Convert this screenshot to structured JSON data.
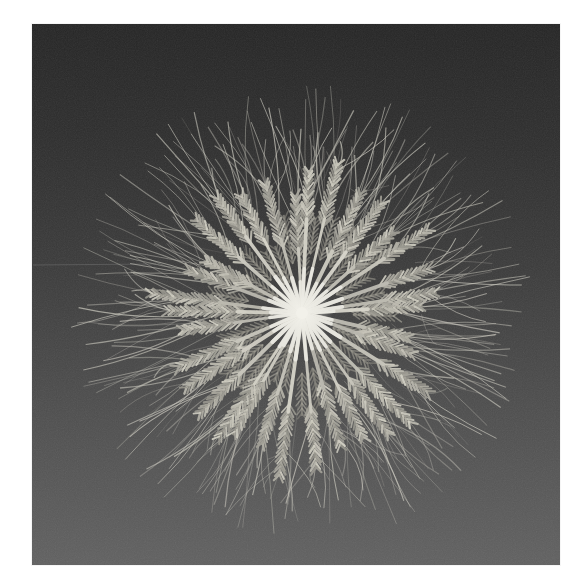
{
  "page": {
    "background_color": "#ffffff",
    "content_type": "photograph"
  },
  "photo": {
    "description": "Black-and-white photograph of ripe bearded wheat ears arranged in a circular starburst, stems meeting at a bright center, long awns fanning outward, on a dark gray gradient studio background with film grain",
    "frame": {
      "left": 32,
      "top": 24,
      "width": 528,
      "height": 541
    },
    "background": {
      "gradient_stops": [
        [
          "0%",
          "#252525"
        ],
        [
          "22%",
          "#2e2e2e"
        ],
        [
          "45%",
          "#3b3b3b"
        ],
        [
          "70%",
          "#4d4d4d"
        ],
        [
          "100%",
          "#616161"
        ]
      ],
      "grain_opacity": 0.1
    },
    "scratch": {
      "x1": 1,
      "y1": 241,
      "x2": 124,
      "y2": 240,
      "color": "#747474",
      "opacity": 0.5
    },
    "wheat": {
      "center_x": 270,
      "center_y": 289,
      "ray_count": 34,
      "seed": 7,
      "stem_inner_color": "#ebeae3",
      "stem_outer_color": "#c9c7bd",
      "ear_color": "#b4b2a8",
      "ear_dark_color": "#8f8d84",
      "awn_color": "#c8c6bc",
      "center_glow_color": "#f2f1ea",
      "stem_max_radius": 100,
      "ear_length_min": 52,
      "ear_length_max": 78,
      "awn_reach_min": 160,
      "awn_reach_max": 232,
      "awns_per_ear": 8,
      "stray_awn_count": 60
    }
  }
}
